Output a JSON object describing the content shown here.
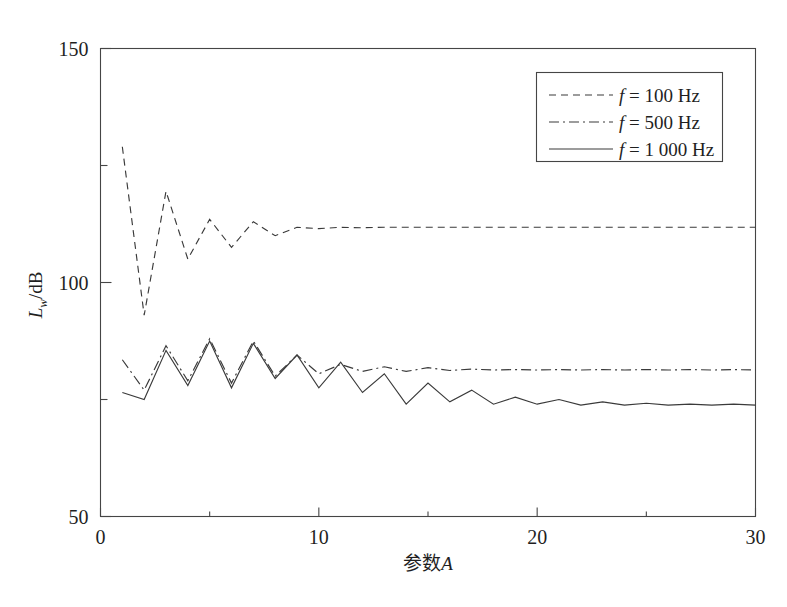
{
  "chart_data": {
    "type": "line",
    "title": "",
    "xlabel": "参数A",
    "ylabel": "L_w/dB",
    "ylabel_main": "L",
    "ylabel_sub": "w",
    "ylabel_tail": "/dB",
    "xlabel_cn": "参数",
    "xlabel_var": "A",
    "xlim": [
      0,
      30
    ],
    "ylim": [
      50,
      150
    ],
    "x_ticks_major": [
      0,
      10,
      20,
      30
    ],
    "x_ticks_minor": [
      5,
      15,
      25
    ],
    "y_ticks_major": [
      50,
      100,
      150
    ],
    "y_ticks_minor": [
      75,
      125
    ],
    "x_tick_labels": [
      "0",
      "10",
      "20",
      "30"
    ],
    "y_tick_labels": [
      "50",
      "100",
      "150"
    ],
    "grid": false,
    "legend_position": "top-right",
    "x": [
      1,
      2,
      3,
      4,
      5,
      6,
      7,
      8,
      9,
      10,
      11,
      12,
      13,
      14,
      15,
      16,
      17,
      18,
      19,
      20,
      21,
      22,
      23,
      24,
      25,
      26,
      27,
      28,
      29,
      30
    ],
    "series": [
      {
        "name": "f = 100 Hz",
        "linestyle": "dashed",
        "dasharray": "7,5",
        "values": [
          129.0,
          93.0,
          119.5,
          105.0,
          113.5,
          107.5,
          113.0,
          110.0,
          111.8,
          111.5,
          111.8,
          111.7,
          111.8,
          111.8,
          111.8,
          111.8,
          111.8,
          111.8,
          111.8,
          111.8,
          111.8,
          111.8,
          111.8,
          111.8,
          111.8,
          111.8,
          111.8,
          111.8,
          111.8,
          111.8
        ]
      },
      {
        "name": "f = 500 Hz",
        "linestyle": "dashdot",
        "dasharray": "10,4,2,4",
        "values": [
          83.5,
          77.0,
          86.5,
          79.0,
          88.0,
          78.5,
          87.5,
          80.0,
          84.5,
          80.5,
          82.5,
          81.0,
          82.0,
          81.0,
          81.8,
          81.2,
          81.5,
          81.3,
          81.4,
          81.3,
          81.4,
          81.3,
          81.4,
          81.3,
          81.4,
          81.3,
          81.4,
          81.3,
          81.4,
          81.3
        ]
      },
      {
        "name": "f = 1 000 Hz",
        "linestyle": "solid",
        "dasharray": "none",
        "values": [
          76.5,
          75.0,
          85.5,
          78.0,
          87.5,
          77.5,
          87.0,
          79.5,
          84.5,
          77.5,
          83.0,
          76.5,
          80.5,
          74.0,
          78.5,
          74.5,
          77.0,
          74.0,
          75.5,
          74.0,
          75.0,
          73.8,
          74.5,
          73.8,
          74.2,
          73.8,
          74.0,
          73.8,
          74.0,
          73.8
        ]
      }
    ]
  },
  "legend": {
    "entries": [
      {
        "label_prefix": "f",
        "label_rest": " = 100 Hz",
        "style": "dashed"
      },
      {
        "label_prefix": "f",
        "label_rest": " = 500 Hz",
        "style": "dashdot"
      },
      {
        "label_prefix": "f",
        "label_rest": " = 1 000 Hz",
        "style": "solid"
      }
    ]
  },
  "axes": {
    "y_label_parts": {
      "main": "L",
      "sub": "w",
      "tail": "/dB"
    },
    "x_label_parts": {
      "cn": "参数",
      "var": "A"
    }
  }
}
